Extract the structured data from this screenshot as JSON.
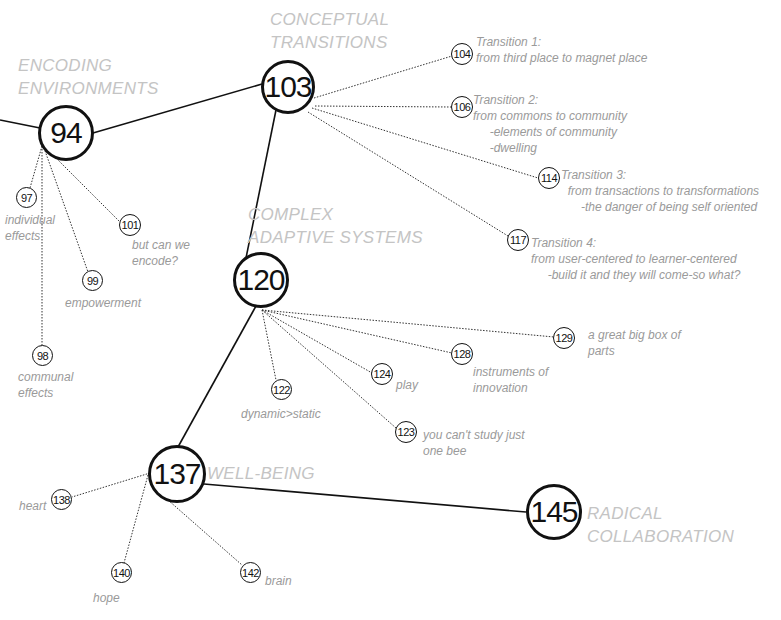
{
  "diagram": {
    "type": "concept-map",
    "hubs": [
      {
        "id": "94",
        "number": "94",
        "heading": "ENCODING\nENVIRONMENTS",
        "heading_lines": [
          "ENCODING",
          "ENVIRONMENTS"
        ]
      },
      {
        "id": "103",
        "number": "103",
        "heading_lines": [
          "CONCEPTUAL",
          "TRANSITIONS"
        ]
      },
      {
        "id": "120",
        "number": "120",
        "heading_lines": [
          "COMPLEX",
          "ADAPTIVE SYSTEMS"
        ]
      },
      {
        "id": "137",
        "number": "137",
        "heading_lines": [
          "WELL-BEING"
        ]
      },
      {
        "id": "145",
        "number": "145",
        "heading_lines": [
          "RADICAL",
          "COLLABORATION"
        ]
      }
    ],
    "leaves": [
      {
        "id": "97",
        "number": "97",
        "parent": "94",
        "label": "individual\neffects"
      },
      {
        "id": "98",
        "number": "98",
        "parent": "94",
        "label": "communal\neffects"
      },
      {
        "id": "99",
        "number": "99",
        "parent": "94",
        "label": "empowerment"
      },
      {
        "id": "101",
        "number": "101",
        "parent": "94",
        "label": "but can we\nencode?"
      },
      {
        "id": "104",
        "number": "104",
        "parent": "103",
        "label": "Transition 1:\nfrom third place to magnet place"
      },
      {
        "id": "106",
        "number": "106",
        "parent": "103",
        "label": "Transition 2:\nfrom commons to community\n     -elements of community\n     -dwelling"
      },
      {
        "id": "114",
        "number": "114",
        "parent": "103",
        "label": "Transition 3:\n  from transactions to transformations\n      -the danger of being self oriented"
      },
      {
        "id": "117",
        "number": "117",
        "parent": "103",
        "label": "Transition 4:\nfrom user-centered to learner-centered\n     -build it and they will come-so what?"
      },
      {
        "id": "122",
        "number": "122",
        "parent": "120",
        "label": "dynamic>static"
      },
      {
        "id": "123",
        "number": "123",
        "parent": "120",
        "label": "you can't study just\none bee"
      },
      {
        "id": "124",
        "number": "124",
        "parent": "120",
        "label": "play"
      },
      {
        "id": "128",
        "number": "128",
        "parent": "120",
        "label": "instruments of\ninnovation"
      },
      {
        "id": "129",
        "number": "129",
        "parent": "120",
        "label": "a great big box of\nparts"
      },
      {
        "id": "138",
        "number": "138",
        "parent": "137",
        "label": "heart"
      },
      {
        "id": "140",
        "number": "140",
        "parent": "137",
        "label": "hope"
      },
      {
        "id": "142",
        "number": "142",
        "parent": "137",
        "label": "brain"
      }
    ],
    "colors": {
      "line": "#111111",
      "heading_text": "#c4c4c4",
      "label_text": "#9a9a9a",
      "background": "#ffffff"
    }
  },
  "headings": {
    "h94": "ENCODING\nENVIRONMENTS",
    "h103": "CONCEPTUAL\nTRANSITIONS",
    "h120": "COMPLEX\nADAPTIVE SYSTEMS",
    "h137": "WELL-BEING",
    "h145": "RADICAL\nCOLLABORATION"
  },
  "nodes": {
    "n94": "94",
    "n103": "103",
    "n120": "120",
    "n137": "137",
    "n145": "145",
    "n97": "97",
    "n98": "98",
    "n99": "99",
    "n101": "101",
    "n104": "104",
    "n106": "106",
    "n114": "114",
    "n117": "117",
    "n122": "122",
    "n123": "123",
    "n124": "124",
    "n128": "128",
    "n129": "129",
    "n138": "138",
    "n140": "140",
    "n142": "142"
  },
  "labels": {
    "l97": "individual\neffects",
    "l98": "communal\neffects",
    "l99": "empowerment",
    "l101": "but can we\nencode?",
    "l104": "Transition 1:\nfrom third place to magnet place",
    "l106": "Transition 2:\nfrom commons to community\n     -elements of community\n     -dwelling",
    "l114": "Transition 3:\n  from transactions to transformations\n      -the danger of being self oriented",
    "l117": "Transition 4:\nfrom user-centered to learner-centered\n     -build it and they will come-so what?",
    "l122": "dynamic>static",
    "l123": "you can't study just\none bee",
    "l124": "play",
    "l128": "instruments of\ninnovation",
    "l129": "a great big box of\nparts",
    "l138": "heart",
    "l140": "hope",
    "l142": "brain"
  }
}
